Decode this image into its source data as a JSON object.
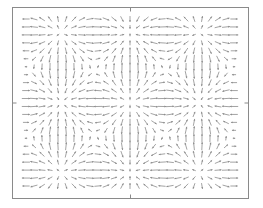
{
  "chart_data": {
    "type": "quiver",
    "title": "",
    "xlabel": "",
    "ylabel": "",
    "grid": false,
    "legend": null,
    "frame": {
      "left": 12,
      "top": 7,
      "right": 248,
      "bottom": 198,
      "color": "#8a8a8a"
    },
    "ticks": {
      "x": [
        {
          "pos": 0.5,
          "label": ""
        }
      ],
      "y": [
        {
          "pos": 0.5,
          "label": ""
        }
      ]
    },
    "field": {
      "description": "periodic gradient-like vector field: radial nodes at quadrant centers and plot center, saddles in between",
      "formula_u": "sin(x)*cos(y)",
      "formula_v": "cos(x)*sin(y)",
      "x_range": [
        -4.71239,
        4.71239
      ],
      "y_range": [
        -3.76991,
        3.76991
      ],
      "nx": 27,
      "ny": 22,
      "arrow_color": "#8c8c8c",
      "max_arrow_len_px": 8.5
    },
    "radial_centers_px": [
      {
        "x": 53,
        "y": 42
      },
      {
        "x": 208,
        "y": 42
      },
      {
        "x": 131,
        "y": 102
      },
      {
        "x": 53,
        "y": 163
      },
      {
        "x": 208,
        "y": 163
      }
    ]
  }
}
